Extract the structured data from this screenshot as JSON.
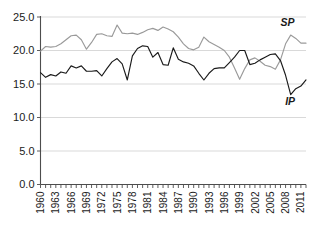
{
  "chart_data": {
    "type": "line",
    "title": "",
    "subtitle": "",
    "xlabel": "",
    "ylabel": "",
    "xlim": [
      1960,
      2012
    ],
    "ylim": [
      0.0,
      25.0
    ],
    "ytick_labels": [
      "25.0",
      "20.0",
      "15.0",
      "10.0",
      "5.0",
      "0.0"
    ],
    "ytick_values": [
      25.0,
      20.0,
      15.0,
      10.0,
      5.0,
      0.0
    ],
    "xtick_labels": [
      "1960",
      "1963",
      "1966",
      "1969",
      "1972",
      "1975",
      "1978",
      "1981",
      "1984",
      "1987",
      "1990",
      "1993",
      "1996",
      "1999",
      "2002",
      "2005",
      "2008",
      "2011"
    ],
    "xtick_values": [
      1960,
      1963,
      1966,
      1969,
      1972,
      1975,
      1978,
      1981,
      1984,
      1987,
      1990,
      1993,
      1996,
      1999,
      2002,
      2005,
      2008,
      2011
    ],
    "minor_tick_interval": 1,
    "grid": true,
    "grid_axis": "y",
    "legend": "inline-annotations",
    "x": [
      1960,
      1961,
      1962,
      1963,
      1964,
      1965,
      1966,
      1967,
      1968,
      1969,
      1970,
      1971,
      1972,
      1973,
      1974,
      1975,
      1976,
      1977,
      1978,
      1979,
      1980,
      1981,
      1982,
      1983,
      1984,
      1985,
      1986,
      1987,
      1988,
      1989,
      1990,
      1991,
      1992,
      1993,
      1994,
      1995,
      1996,
      1997,
      1998,
      1999,
      2000,
      2001,
      2002,
      2003,
      2004,
      2005,
      2006,
      2007,
      2008,
      2009,
      2010,
      2011,
      2012
    ],
    "series": [
      {
        "name": "SP",
        "label": "SP",
        "color": "#9a9a9a",
        "annotation": "SP",
        "values": [
          19.9,
          20.6,
          20.5,
          20.6,
          21.0,
          21.6,
          22.2,
          22.3,
          21.6,
          20.2,
          21.2,
          22.4,
          22.5,
          22.2,
          22.1,
          23.8,
          22.6,
          22.5,
          22.6,
          22.4,
          22.7,
          23.1,
          23.3,
          23.0,
          23.5,
          23.2,
          22.8,
          22.0,
          21.0,
          20.3,
          20.1,
          20.5,
          22.0,
          21.3,
          20.9,
          20.5,
          20.0,
          19.0,
          17.4,
          15.7,
          17.3,
          18.6,
          18.9,
          18.4,
          17.8,
          17.6,
          17.2,
          18.6,
          21.0,
          22.3,
          21.8,
          21.1,
          21.1
        ]
      },
      {
        "name": "IP",
        "label": "IP",
        "color": "#1a1a1a",
        "annotation": "IP",
        "values": [
          16.7,
          16.0,
          16.4,
          16.2,
          16.8,
          16.6,
          17.7,
          17.4,
          17.7,
          16.9,
          16.9,
          17.0,
          16.2,
          17.3,
          18.3,
          18.8,
          18.0,
          15.6,
          19.2,
          20.3,
          20.7,
          20.6,
          19.0,
          19.7,
          17.9,
          17.8,
          20.4,
          18.7,
          18.3,
          18.1,
          17.7,
          16.6,
          15.6,
          16.6,
          17.3,
          17.4,
          17.4,
          18.2,
          19.0,
          20.0,
          20.0,
          17.9,
          18.1,
          18.6,
          19.0,
          19.4,
          19.5,
          18.5,
          16.3,
          13.4,
          14.3,
          14.7,
          15.6
        ]
      }
    ]
  },
  "annotations": {
    "sp_label": "SP",
    "ip_label": "IP"
  }
}
